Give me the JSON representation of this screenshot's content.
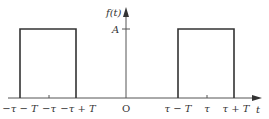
{
  "diagram": {
    "type": "periodic-rectangular-pulses",
    "y_axis_label": "f(t)",
    "x_axis_label": "t",
    "amplitude_label": "A",
    "origin_label": "O",
    "x_ticks": [
      "−τ − T",
      "−τ",
      "−τ + T",
      "τ − T",
      "τ",
      "τ + T"
    ],
    "pulses": [
      {
        "start": "−τ − T",
        "end": "−τ + T",
        "height": "A"
      },
      {
        "start": "τ − T",
        "end": "τ + T",
        "height": "A"
      }
    ],
    "colors": {
      "line": "#333333",
      "background": "#ffffff"
    }
  }
}
